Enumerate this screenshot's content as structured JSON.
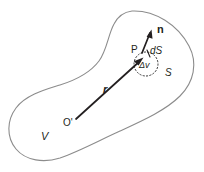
{
  "figure": {
    "background_color": "#ffffff",
    "ink_color": "#231f20",
    "outline_color": "#8c8c8c",
    "labels": {
      "normal_vector": "n",
      "point": "P",
      "surface_element": "dS",
      "volume_element": "Δv",
      "surface": "S",
      "position_vector": "r",
      "origin": "O'",
      "volume": "V"
    },
    "elements": {
      "blob_name": "volume-boundary-surface",
      "dotted_circle_name": "volume-element-circle",
      "position_arrow_name": "position-vector-arrow",
      "normal_arrow_name": "normal-vector-arrow"
    }
  }
}
